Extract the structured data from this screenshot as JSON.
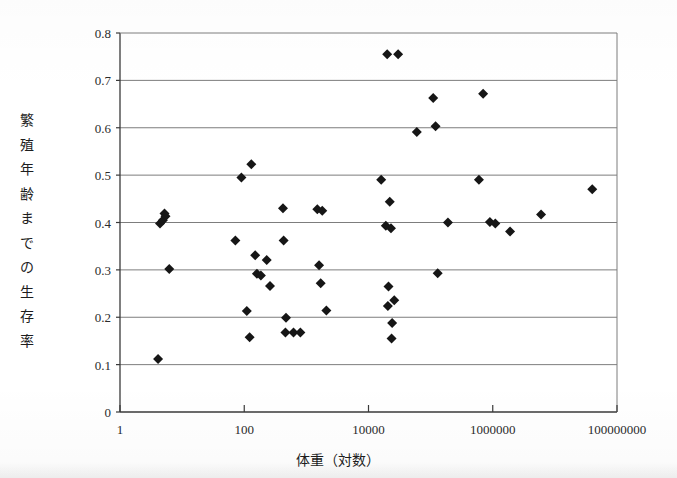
{
  "chart_data": {
    "type": "scatter",
    "title": "",
    "xlabel": "体重（対数）",
    "ylabel": "繁殖年齢までの生存率",
    "xscale": "log",
    "xlim": [
      1,
      100000000
    ],
    "ylim": [
      0,
      0.8
    ],
    "grid": true,
    "legend": "none",
    "marker": "diamond",
    "marker_color": "#161616",
    "xticks": [
      {
        "value": 1,
        "label": "1"
      },
      {
        "value": 100,
        "label": "100"
      },
      {
        "value": 10000,
        "label": "10000"
      },
      {
        "value": 1000000,
        "label": "1000000"
      },
      {
        "value": 100000000,
        "label": "100000000"
      }
    ],
    "yticks": [
      {
        "value": 0,
        "label": "0"
      },
      {
        "value": 0.1,
        "label": "0.1"
      },
      {
        "value": 0.2,
        "label": "0.2"
      },
      {
        "value": 0.3,
        "label": "0.3"
      },
      {
        "value": 0.4,
        "label": "0.4"
      },
      {
        "value": 0.5,
        "label": "0.5"
      },
      {
        "value": 0.6,
        "label": "0.6"
      },
      {
        "value": 0.7,
        "label": "0.7"
      },
      {
        "value": 0.8,
        "label": "0.8"
      }
    ],
    "ylabel_chars": [
      "繁",
      "殖",
      "年",
      "齢",
      "ま",
      "で",
      "の",
      "生",
      "存",
      "率"
    ],
    "points": [
      {
        "x": 4.1,
        "y": 0.112
      },
      {
        "x": 4.4,
        "y": 0.398
      },
      {
        "x": 4.9,
        "y": 0.405
      },
      {
        "x": 5.2,
        "y": 0.419
      },
      {
        "x": 5.4,
        "y": 0.413
      },
      {
        "x": 6.2,
        "y": 0.302
      },
      {
        "x": 90,
        "y": 0.495
      },
      {
        "x": 72,
        "y": 0.362
      },
      {
        "x": 110,
        "y": 0.213
      },
      {
        "x": 122,
        "y": 0.158
      },
      {
        "x": 130,
        "y": 0.523
      },
      {
        "x": 150,
        "y": 0.331
      },
      {
        "x": 160,
        "y": 0.292
      },
      {
        "x": 185,
        "y": 0.288
      },
      {
        "x": 230,
        "y": 0.321
      },
      {
        "x": 260,
        "y": 0.266
      },
      {
        "x": 420,
        "y": 0.43
      },
      {
        "x": 430,
        "y": 0.362
      },
      {
        "x": 470,
        "y": 0.199
      },
      {
        "x": 460,
        "y": 0.168
      },
      {
        "x": 620,
        "y": 0.168
      },
      {
        "x": 800,
        "y": 0.168
      },
      {
        "x": 1500,
        "y": 0.428
      },
      {
        "x": 1800,
        "y": 0.425
      },
      {
        "x": 1600,
        "y": 0.31
      },
      {
        "x": 1700,
        "y": 0.272
      },
      {
        "x": 2100,
        "y": 0.214
      },
      {
        "x": 16000,
        "y": 0.49
      },
      {
        "x": 19000,
        "y": 0.393
      },
      {
        "x": 23000,
        "y": 0.388
      },
      {
        "x": 22000,
        "y": 0.444
      },
      {
        "x": 20000,
        "y": 0.755
      },
      {
        "x": 30000,
        "y": 0.755
      },
      {
        "x": 21000,
        "y": 0.265
      },
      {
        "x": 20500,
        "y": 0.224
      },
      {
        "x": 26000,
        "y": 0.236
      },
      {
        "x": 24000,
        "y": 0.188
      },
      {
        "x": 23500,
        "y": 0.155
      },
      {
        "x": 60000,
        "y": 0.591
      },
      {
        "x": 120000,
        "y": 0.603
      },
      {
        "x": 110000,
        "y": 0.663
      },
      {
        "x": 130000,
        "y": 0.293
      },
      {
        "x": 190000,
        "y": 0.4
      },
      {
        "x": 700000,
        "y": 0.672
      },
      {
        "x": 600000,
        "y": 0.49
      },
      {
        "x": 900000,
        "y": 0.401
      },
      {
        "x": 1100000,
        "y": 0.398
      },
      {
        "x": 1900000,
        "y": 0.381
      },
      {
        "x": 6000000,
        "y": 0.417
      },
      {
        "x": 40000000,
        "y": 0.47
      }
    ]
  }
}
